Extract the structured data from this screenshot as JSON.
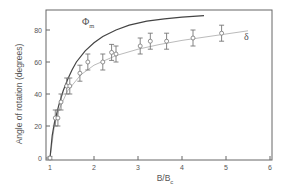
{
  "chart_data": {
    "type": "scatter",
    "title": "",
    "xlabel": "B/B",
    "xlabel_sub": "c",
    "ylabel": "Angle of rotation (degrees)",
    "xlim": [
      0.9,
      6.05
    ],
    "ylim": [
      -2,
      92
    ],
    "xticks": [
      1,
      2,
      3,
      4,
      5,
      6
    ],
    "yticks": [
      0,
      20,
      40,
      60,
      80
    ],
    "grid": false,
    "legend": "inline labels",
    "series": [
      {
        "name": "Φm",
        "label_main": "Φ",
        "label_sub": "m",
        "kind": "line",
        "color": "#444444",
        "x": [
          1.0,
          1.05,
          1.1,
          1.2,
          1.3,
          1.4,
          1.5,
          1.6,
          1.8,
          2.0,
          2.2,
          2.5,
          2.8,
          3.2,
          3.6,
          4.0,
          4.5
        ],
        "y": [
          0,
          14,
          22,
          33,
          42,
          49,
          55,
          60,
          67,
          72,
          76,
          80,
          83,
          85.5,
          87,
          88,
          89
        ]
      },
      {
        "name": "δ",
        "label_main": "δ",
        "kind": "points_with_errorbars_and_fit",
        "color": "#777777",
        "fit_color": "#bbbbbb",
        "x": [
          1.0,
          1.12,
          1.18,
          1.25,
          1.38,
          1.45,
          1.68,
          1.86,
          2.2,
          2.4,
          2.5,
          3.05,
          3.28,
          3.65,
          4.25,
          4.9
        ],
        "y": [
          0,
          25,
          25,
          35,
          45,
          45,
          53,
          60,
          60,
          66,
          65,
          70,
          73,
          73,
          75,
          78
        ],
        "yerr": [
          1,
          5,
          5,
          5,
          5,
          5,
          5,
          5,
          5,
          5,
          5,
          5,
          5,
          5,
          5,
          5
        ],
        "fit_x": [
          1.0,
          1.1,
          1.2,
          1.4,
          1.7,
          2.0,
          2.5,
          3.0,
          3.5,
          4.0,
          4.5,
          5.0,
          5.5
        ],
        "fit_y": [
          0,
          20,
          30,
          42,
          52,
          58,
          64,
          68,
          71,
          73.5,
          75.5,
          77.5,
          79.5
        ]
      }
    ]
  }
}
